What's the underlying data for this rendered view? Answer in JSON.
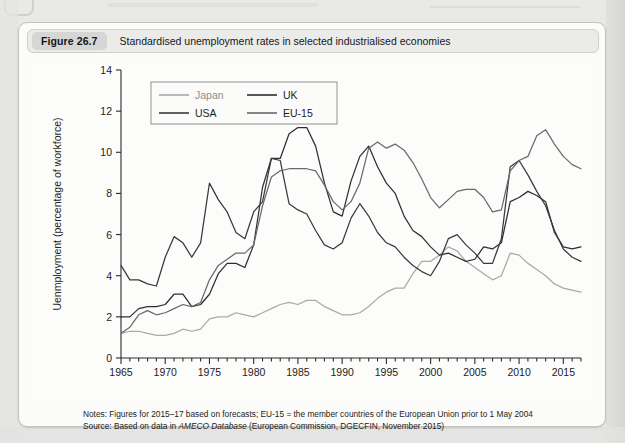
{
  "figure": {
    "badge": "Figure 26.7",
    "caption": "Standardised unemployment rates in selected industrialised economies"
  },
  "notes": {
    "line1_lead": "Notes:",
    "line1": " Figures for 2015–17 based on forecasts; EU-15 = the member countries of the European Union prior to 1 May 2004",
    "line2_lead": "Source:",
    "line2_a": " Based on data in ",
    "line2_ital": "AMECO Database",
    "line2_b": " (European Commission, DGECFIN, November 2015)"
  },
  "colors": {
    "japan": "#a9a9a9",
    "uk": "#2f2f33",
    "usa": "#3a3a3e",
    "eu15": "#6a6a6e",
    "axis": "#2b2b2f",
    "panel_bg": "#fcfcfb",
    "card_bg": "#fbfbfa",
    "badge_bg": "#d6d6d4",
    "caption_bg": "#ebebe9"
  },
  "chart_data": {
    "type": "line",
    "title": "Standardised unemployment rates in selected industrialised economies",
    "xlabel": "",
    "ylabel": "Uenmployment (percentage of workforce)",
    "xlim": [
      1965,
      2017
    ],
    "ylim": [
      0,
      14
    ],
    "ytick_step": 2,
    "yticks": [
      0,
      2,
      4,
      6,
      8,
      10,
      12,
      14
    ],
    "xticks_major": [
      1965,
      1970,
      1975,
      1980,
      1985,
      1990,
      1995,
      2000,
      2005,
      2010,
      2015
    ],
    "xtick_minor_step": 1,
    "grid": false,
    "legend_position": "top-left",
    "legend": [
      "Japan",
      "UK",
      "USA",
      "EU-15"
    ],
    "x": [
      1965,
      1966,
      1967,
      1968,
      1969,
      1970,
      1971,
      1972,
      1973,
      1974,
      1975,
      1976,
      1977,
      1978,
      1979,
      1980,
      1981,
      1982,
      1983,
      1984,
      1985,
      1986,
      1987,
      1988,
      1989,
      1990,
      1991,
      1992,
      1993,
      1994,
      1995,
      1996,
      1997,
      1998,
      1999,
      2000,
      2001,
      2002,
      2003,
      2004,
      2005,
      2006,
      2007,
      2008,
      2009,
      2010,
      2011,
      2012,
      2013,
      2014,
      2015,
      2016,
      2017
    ],
    "series": [
      {
        "name": "Japan",
        "color": "#a9a9a9",
        "values": [
          1.2,
          1.3,
          1.3,
          1.2,
          1.1,
          1.1,
          1.2,
          1.4,
          1.3,
          1.4,
          1.9,
          2.0,
          2.0,
          2.2,
          2.1,
          2.0,
          2.2,
          2.4,
          2.6,
          2.7,
          2.6,
          2.8,
          2.8,
          2.5,
          2.3,
          2.1,
          2.1,
          2.2,
          2.5,
          2.9,
          3.2,
          3.4,
          3.4,
          4.1,
          4.7,
          4.7,
          5.0,
          5.4,
          5.2,
          4.7,
          4.4,
          4.1,
          3.8,
          4.0,
          5.1,
          5.0,
          4.6,
          4.3,
          4.0,
          3.6,
          3.4,
          3.3,
          3.2
        ]
      },
      {
        "name": "UK",
        "color": "#2f2f33",
        "values": [
          2.0,
          2.0,
          2.4,
          2.5,
          2.5,
          2.6,
          3.1,
          3.1,
          2.5,
          2.6,
          3.1,
          4.1,
          4.6,
          4.6,
          4.4,
          5.5,
          8.3,
          9.7,
          9.7,
          10.9,
          11.2,
          11.2,
          10.3,
          8.5,
          7.1,
          6.9,
          8.6,
          9.8,
          10.3,
          9.3,
          8.5,
          8.0,
          6.9,
          6.2,
          5.9,
          5.4,
          5.0,
          5.1,
          4.9,
          4.7,
          4.8,
          5.4,
          5.3,
          5.6,
          7.6,
          7.8,
          8.1,
          7.9,
          7.6,
          6.1,
          5.4,
          5.3,
          5.4
        ]
      },
      {
        "name": "USA",
        "color": "#3a3a3e",
        "values": [
          4.5,
          3.8,
          3.8,
          3.6,
          3.5,
          4.9,
          5.9,
          5.6,
          4.9,
          5.6,
          8.5,
          7.7,
          7.1,
          6.1,
          5.8,
          7.1,
          7.6,
          9.7,
          9.6,
          7.5,
          7.2,
          7.0,
          6.2,
          5.5,
          5.3,
          5.6,
          6.8,
          7.5,
          6.9,
          6.1,
          5.6,
          5.4,
          4.9,
          4.5,
          4.2,
          4.0,
          4.7,
          5.8,
          6.0,
          5.5,
          5.1,
          4.6,
          4.6,
          5.8,
          9.3,
          9.6,
          8.9,
          8.1,
          7.4,
          6.2,
          5.3,
          4.9,
          4.7
        ]
      },
      {
        "name": "EU-15",
        "color": "#6a6a6e",
        "values": [
          1.2,
          1.5,
          2.1,
          2.3,
          2.1,
          2.2,
          2.4,
          2.6,
          2.5,
          2.7,
          3.8,
          4.5,
          4.8,
          5.1,
          5.1,
          5.5,
          7.4,
          8.8,
          9.1,
          9.2,
          9.2,
          9.2,
          9.1,
          8.4,
          7.6,
          7.2,
          7.6,
          8.5,
          10.2,
          10.5,
          10.2,
          10.4,
          10.1,
          9.5,
          8.7,
          7.8,
          7.3,
          7.7,
          8.1,
          8.2,
          8.2,
          7.8,
          7.1,
          7.2,
          9.1,
          9.6,
          9.8,
          10.8,
          11.1,
          10.4,
          9.8,
          9.4,
          9.2
        ]
      }
    ]
  }
}
